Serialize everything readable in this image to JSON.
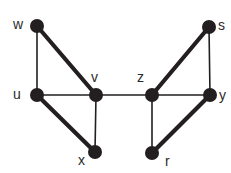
{
  "figure": {
    "type": "undirected-graph-diagram",
    "width": 231,
    "height": 173,
    "background_color": "#ffffff",
    "node_color": "#231f20",
    "edge_color": "#231f20",
    "label_color": "#2b2b2b",
    "node_radius": 7,
    "thin_edge_width": 1.6,
    "thick_edge_width": 4.2
  },
  "graph_data": {
    "type": "graph",
    "directed": false,
    "node_count": 8,
    "edge_count": 11,
    "nodes": [
      {
        "id": "w",
        "label": "w",
        "cx": 37,
        "cy": 26,
        "label_x": 13,
        "label_y": 17
      },
      {
        "id": "s",
        "label": "s",
        "cx": 209,
        "cy": 27,
        "label_x": 218,
        "label_y": 18
      },
      {
        "id": "u",
        "label": "u",
        "cx": 37,
        "cy": 95,
        "label_x": 13,
        "label_y": 87
      },
      {
        "id": "v",
        "label": "v",
        "cx": 96,
        "cy": 95,
        "label_x": 91,
        "label_y": 70
      },
      {
        "id": "z",
        "label": "z",
        "cx": 152,
        "cy": 95,
        "label_x": 137,
        "label_y": 70
      },
      {
        "id": "y",
        "label": "y",
        "cx": 210,
        "cy": 95,
        "label_x": 219,
        "label_y": 88
      },
      {
        "id": "x",
        "label": "x",
        "cx": 95,
        "cy": 152,
        "label_x": 78,
        "label_y": 153
      },
      {
        "id": "r",
        "label": "r",
        "cx": 152,
        "cy": 153,
        "label_x": 165,
        "label_y": 154
      }
    ],
    "edges": [
      {
        "source": "w",
        "target": "u",
        "weight": "thin",
        "x1": 37,
        "y1": 26,
        "x2": 37,
        "y2": 95
      },
      {
        "source": "w",
        "target": "v",
        "weight": "thick",
        "x1": 37,
        "y1": 26,
        "x2": 96,
        "y2": 95
      },
      {
        "source": "u",
        "target": "v",
        "weight": "thin",
        "x1": 37,
        "y1": 95,
        "x2": 96,
        "y2": 95
      },
      {
        "source": "u",
        "target": "x",
        "weight": "thick",
        "x1": 37,
        "y1": 95,
        "x2": 95,
        "y2": 152
      },
      {
        "source": "v",
        "target": "x",
        "weight": "thin",
        "x1": 96,
        "y1": 95,
        "x2": 95,
        "y2": 152
      },
      {
        "source": "v",
        "target": "z",
        "weight": "thin",
        "x1": 96,
        "y1": 95,
        "x2": 152,
        "y2": 95
      },
      {
        "source": "z",
        "target": "s",
        "weight": "thick",
        "x1": 152,
        "y1": 95,
        "x2": 209,
        "y2": 27
      },
      {
        "source": "s",
        "target": "y",
        "weight": "thin",
        "x1": 209,
        "y1": 27,
        "x2": 210,
        "y2": 95
      },
      {
        "source": "z",
        "target": "y",
        "weight": "thin",
        "x1": 152,
        "y1": 95,
        "x2": 210,
        "y2": 95
      },
      {
        "source": "z",
        "target": "r",
        "weight": "thin",
        "x1": 152,
        "y1": 95,
        "x2": 152,
        "y2": 153
      },
      {
        "source": "r",
        "target": "y",
        "weight": "thick",
        "x1": 152,
        "y1": 153,
        "x2": 210,
        "y2": 95
      }
    ]
  }
}
